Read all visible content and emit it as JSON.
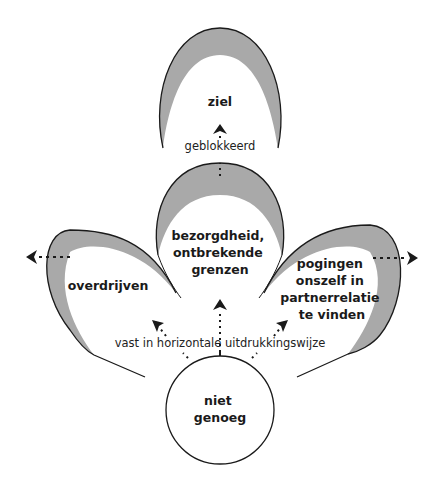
{
  "diagram": {
    "colors": {
      "outline": "#1a1a1a",
      "shading": "#a9a9a9",
      "background": "#ffffff"
    },
    "nodes": {
      "top": {
        "lines": [
          "ziel"
        ]
      },
      "middle": {
        "lines": [
          "bezorgdheid,",
          "ontbrekende",
          "grenzen"
        ]
      },
      "left": {
        "lines": [
          "overdrijven"
        ]
      },
      "right": {
        "lines": [
          "pogingen",
          "onszelf in",
          "partnerrelatie",
          "te vinden"
        ]
      },
      "center": {
        "lines": [
          "niet",
          "genoeg"
        ]
      }
    },
    "labels": {
      "blocked": "geblokkeerd",
      "horizontal": "vast in horizontale uitdrukkingswijze"
    },
    "arrows": [
      {
        "name": "arrow-blocked-up",
        "direction": "up"
      },
      {
        "name": "arrow-center-up",
        "direction": "up"
      },
      {
        "name": "arrow-center-left",
        "direction": "up-left"
      },
      {
        "name": "arrow-center-right",
        "direction": "up-right"
      },
      {
        "name": "arrow-left-out",
        "direction": "left"
      },
      {
        "name": "arrow-right-out",
        "direction": "right"
      }
    ]
  }
}
